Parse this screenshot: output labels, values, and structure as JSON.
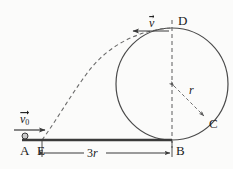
{
  "figure": {
    "type": "physics-diagram",
    "background_color": "#fbfbfa",
    "stroke_color": "#4a4a4a",
    "ground_color": "#3a3a3a",
    "text_color": "#1a1a1a"
  },
  "points": {
    "a": {
      "label": "A",
      "x": 24,
      "y": 152
    },
    "e": {
      "label": "E",
      "x": 41,
      "y": 152
    },
    "b": {
      "label": "B",
      "x": 178,
      "y": 152
    },
    "c": {
      "label": "C",
      "x": 211,
      "y": 124
    },
    "d": {
      "label": "D",
      "x": 181,
      "y": 22
    }
  },
  "vectors": {
    "v0": {
      "label": "v",
      "subscript": "0",
      "x": 18,
      "y": 112,
      "arrow_from_x": 14,
      "arrow_to_x": 45,
      "arrow_y": 130
    },
    "v": {
      "label": "v",
      "subscript": "",
      "x": 148,
      "y": 16,
      "arrow_from_x": 168,
      "arrow_to_x": 135,
      "arrow_y": 31
    }
  },
  "dimensions": {
    "base": {
      "label": "3",
      "italic_part": "r",
      "x": 90,
      "y": 148,
      "from_x": 42,
      "to_x": 172,
      "y_line": 153
    },
    "radius": {
      "label": "r",
      "x": 190,
      "y": 90,
      "from_x": 172,
      "from_y": 84,
      "to_x": 206,
      "to_y": 118
    }
  },
  "geometry": {
    "loop": {
      "center_x": 172,
      "center_y": 84,
      "radius": 56
    },
    "ground": {
      "from_x": 22,
      "to_x": 172,
      "y": 140
    },
    "ball": {
      "x": 25,
      "y": 136,
      "radius": 3
    },
    "axis": {
      "x": 172,
      "from_y": 20,
      "to_y": 148
    }
  }
}
